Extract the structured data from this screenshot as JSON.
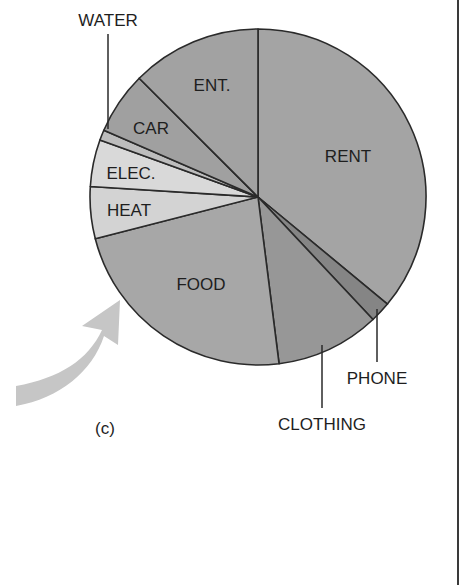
{
  "figure": {
    "panel_label": "(c)",
    "arrow": {
      "color": "#c6c6c6",
      "direction": "up-right"
    }
  },
  "chart_data": {
    "type": "pie",
    "title": "",
    "start_angle_deg": 0,
    "direction": "clockwise",
    "categories": [
      "RENT",
      "PHONE",
      "CLOTHING",
      "FOOD",
      "HEAT",
      "ELEC.",
      "WATER",
      "CAR",
      "ENT."
    ],
    "values": [
      36,
      2,
      10,
      23,
      5,
      4.5,
      1,
      6,
      12.5
    ],
    "unit": "percent (estimated from slice angles)",
    "colors": [
      "#a4a4a4",
      "#858585",
      "#979797",
      "#a7a7a7",
      "#d3d3d3",
      "#d9d9d9",
      "#bdbdbd",
      "#a0a0a0",
      "#a2a2a2"
    ],
    "labels": [
      {
        "text": "RENT",
        "placement": "inside",
        "x": 348,
        "y": 162
      },
      {
        "text": "PHONE",
        "placement": "outside",
        "x": 377,
        "y": 384,
        "leader": [
          377,
          309,
          377,
          362
        ]
      },
      {
        "text": "CLOTHING",
        "placement": "outside",
        "x": 322,
        "y": 430,
        "leader": [
          322,
          345,
          322,
          408
        ]
      },
      {
        "text": "FOOD",
        "placement": "inside",
        "x": 201,
        "y": 290
      },
      {
        "text": "HEAT",
        "placement": "inside",
        "x": 129,
        "y": 216
      },
      {
        "text": "ELEC.",
        "placement": "inside",
        "x": 131,
        "y": 179
      },
      {
        "text": "WATER",
        "placement": "outside",
        "x": 108,
        "y": 26,
        "leader": [
          108,
          34,
          108,
          129
        ]
      },
      {
        "text": "CAR",
        "placement": "inside",
        "x": 151,
        "y": 134
      },
      {
        "text": "ENT.",
        "placement": "inside",
        "x": 212,
        "y": 91
      }
    ],
    "center": [
      258,
      197
    ],
    "radius": 168,
    "legend": "none",
    "grid": false
  }
}
